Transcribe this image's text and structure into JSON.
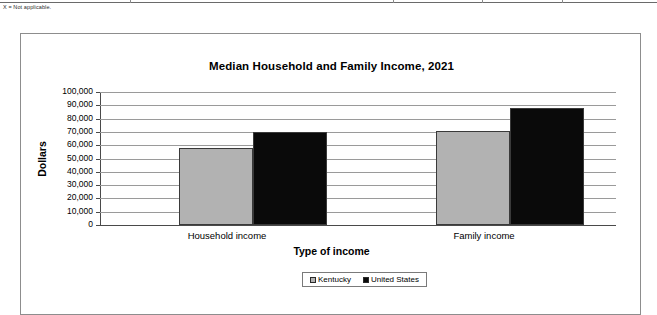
{
  "footnote": "X = Not applicable.",
  "legend": {
    "position": "bottom-center",
    "items": [
      {
        "label": "Kentucky",
        "color": "#b2b2b2",
        "swatch_name": "legend-swatch-kentucky"
      },
      {
        "label": "United States",
        "color": "#0a0a0a",
        "swatch_name": "legend-swatch-united-states"
      }
    ]
  },
  "chart_data": {
    "type": "bar",
    "title": "Median Household and Family Income, 2021",
    "xlabel": "Type of income",
    "ylabel": "Dollars",
    "categories": [
      "Household income",
      "Family income"
    ],
    "series": [
      {
        "name": "Kentucky",
        "color": "#b2b2b2",
        "values": [
          58000,
          71000
        ]
      },
      {
        "name": "United States",
        "color": "#0a0a0a",
        "values": [
          70000,
          88000
        ]
      }
    ],
    "ylim": [
      0,
      100000
    ],
    "ytick_step": 10000,
    "ytick_labels": [
      "0",
      "10,000",
      "20,000",
      "30,000",
      "40,000",
      "50,000",
      "60,000",
      "70,000",
      "80,000",
      "90,000",
      "100,000"
    ],
    "grid": true,
    "legend_position": "bottom-center"
  }
}
